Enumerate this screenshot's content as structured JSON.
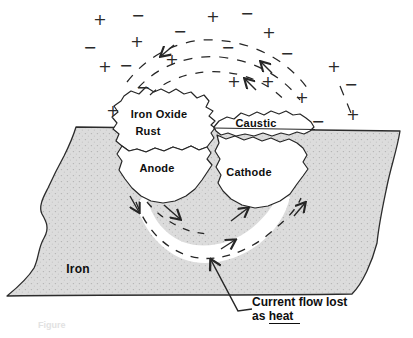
{
  "diagram": {
    "labels": {
      "iron_oxide": "Iron Oxide",
      "rust": "Rust",
      "caustic": "Caustic",
      "anode": "Anode",
      "cathode": "Cathode",
      "iron": "Iron"
    },
    "annotation": {
      "line1": "Current flow lost",
      "line2_prefix": "as ",
      "underlined_word": "heat"
    },
    "caption_fragment": "Figure",
    "ions": {
      "glyphs": {
        "plus": "+",
        "minus": "−"
      },
      "plus": [
        [
          100,
          20
        ],
        [
          213,
          17
        ],
        [
          137,
          42
        ],
        [
          269,
          33
        ],
        [
          105,
          67
        ],
        [
          172,
          60
        ],
        [
          334,
          67
        ],
        [
          234,
          82
        ],
        [
          268,
          82
        ],
        [
          302,
          98
        ],
        [
          353,
          115
        ],
        [
          113,
          111
        ]
      ],
      "minus": [
        [
          138,
          16
        ],
        [
          247,
          14
        ],
        [
          90,
          48
        ],
        [
          180,
          32
        ],
        [
          228,
          48
        ],
        [
          287,
          54
        ],
        [
          126,
          66
        ],
        [
          351,
          85
        ],
        [
          143,
          88
        ],
        [
          318,
          122
        ]
      ]
    },
    "colors": {
      "background": "#ffffff",
      "iron_fill": "#dcdcdc",
      "iron_speckle": "#b2b2b2",
      "line": "#262626",
      "text": "#0e0e0e"
    }
  }
}
